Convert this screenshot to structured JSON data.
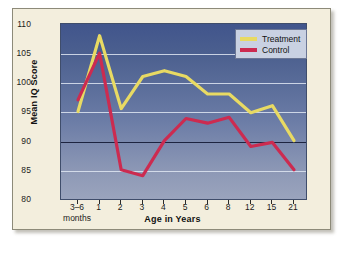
{
  "chart_data": {
    "type": "line",
    "title": "",
    "xlabel": "Age in Years",
    "ylabel": "Mean IQ Score",
    "ylim": [
      80,
      110
    ],
    "yticks": [
      80,
      85,
      90,
      95,
      100,
      105,
      110
    ],
    "grid": true,
    "reference_line": 90,
    "legend_position": "top-right",
    "categories": [
      "3–6 months",
      "1",
      "2",
      "3",
      "4",
      "5",
      "6",
      "8",
      "12",
      "15",
      "21"
    ],
    "x_tick_labels": [
      "3–6",
      "1",
      "2",
      "3",
      "4",
      "5",
      "6",
      "8",
      "12",
      "15",
      "21"
    ],
    "x_tick_sublabel": "months",
    "series": [
      {
        "name": "Treatment",
        "color": "#e8da63",
        "values": [
          95,
          108,
          95.5,
          101,
          102,
          101,
          98,
          98,
          94.8,
          96,
          90
        ]
      },
      {
        "name": "Control",
        "color": "#cc2b50",
        "values": [
          97,
          105,
          85,
          84,
          90,
          93.8,
          93,
          94,
          89,
          89.7,
          85
        ]
      }
    ]
  },
  "legend": {
    "items": [
      {
        "label": "Treatment",
        "color": "#e8da63"
      },
      {
        "label": "Control",
        "color": "#cc2b50"
      }
    ]
  },
  "axis": {
    "y_title": "Mean IQ Score",
    "x_title": "Age in Years"
  },
  "colors": {
    "page_background": "#f3eedd",
    "plot_top": "#41558c",
    "plot_bottom": "#9aa4bd",
    "gridline": "#dfe6f2",
    "reference_line": "#1d2440",
    "treatment": "#e8da63",
    "control": "#cc2b50",
    "legend_background": "#c9d1e2"
  }
}
